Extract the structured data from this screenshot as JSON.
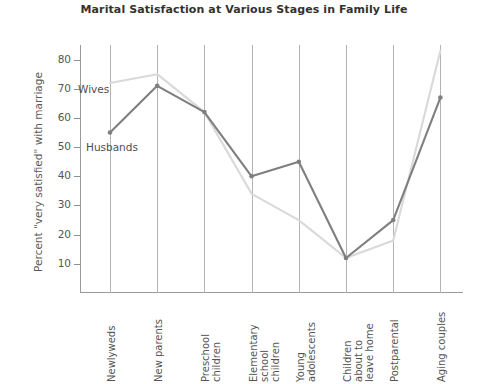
{
  "chart_data": {
    "type": "line",
    "title": "Marital Satisfaction at Various Stages in Family Life",
    "xlabel": "",
    "ylabel": "Percent \"very satisfied\" with marriage",
    "categories": [
      "Newlyweds",
      "New parents",
      "Preschool children",
      "Elementary school children",
      "Young adolescents",
      "Children about to leave home",
      "Postparental",
      "Aging couples"
    ],
    "category_lines": [
      [
        "Newlyweds"
      ],
      [
        "New parents"
      ],
      [
        "Preschool",
        "children"
      ],
      [
        "Elementary",
        "school",
        "children"
      ],
      [
        "Young",
        "adolescents"
      ],
      [
        "Children",
        "about to",
        "leave home"
      ],
      [
        "Postparental"
      ],
      [
        "Aging couples"
      ]
    ],
    "series": [
      {
        "name": "Wives",
        "color": "#d9d9d9",
        "values": [
          72,
          75,
          62,
          34,
          25,
          12,
          18,
          83
        ]
      },
      {
        "name": "Husbands",
        "color": "#7f7f7f",
        "values": [
          55,
          71,
          62,
          40,
          45,
          12,
          25,
          67
        ]
      }
    ],
    "ylim": [
      0,
      85
    ],
    "yticks": [
      10,
      20,
      30,
      40,
      50,
      60,
      70,
      80
    ],
    "ytick_labels": [
      "10",
      "20",
      "30",
      "40",
      "50",
      "60",
      "70",
      "80"
    ],
    "grid": "vertical",
    "legend": "inline-annotations",
    "annotations": [
      {
        "text": "Wives",
        "series": "Wives"
      },
      {
        "text": "Husbands",
        "series": "Husbands"
      }
    ],
    "title_color": "#33322f",
    "axis_color": "#9a9a9a",
    "grid_color": "#b4b4b4",
    "background": "#ffffff"
  }
}
